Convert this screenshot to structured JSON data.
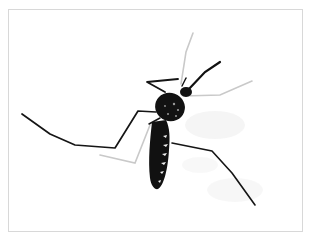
{
  "image": {
    "subject": "mosquito",
    "description": "High-contrast black and white photograph of a mosquito with long legs on a white background, framed by a thin light gray border",
    "colors": {
      "background": "#ffffff",
      "frame": "#d8d8d8",
      "subject": "#111111",
      "shadow": "#e6e6e6"
    }
  }
}
